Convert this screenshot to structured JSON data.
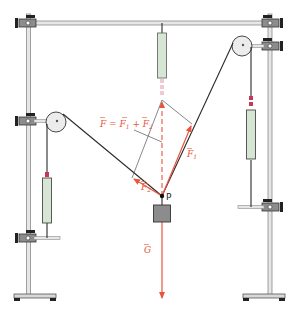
{
  "diagram": {
    "labels": {
      "resultant_equation": "F = F1 + F2",
      "resultant_eq_parts": [
        "F",
        " = ",
        "F",
        "1",
        " + ",
        "F",
        "2"
      ],
      "force_1": "F",
      "force_1_sub": "1",
      "force_2": "F",
      "force_2_sub": "2",
      "weight": "G",
      "point": "P"
    },
    "colors": {
      "force_arrow": "#e8553d",
      "rope": "#2a2a2a",
      "frame": "#9a9a9a",
      "frame_light": "#e6e6e6",
      "spring_body": "#d5e6d2",
      "spring_marker": "#c8365a",
      "mass": "#8c8c8c",
      "clamp": "#6d6d6d",
      "pulley": "#ececec"
    },
    "components": [
      "stand-left",
      "stand-right",
      "crossbar",
      "pulley-left",
      "pulley-right",
      "spring-scale-top",
      "spring-scale-left",
      "spring-scale-right",
      "mass-block",
      "clamps"
    ]
  }
}
